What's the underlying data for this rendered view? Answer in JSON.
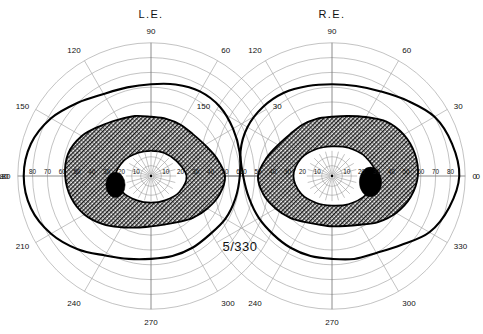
{
  "document": {
    "title": "Goldmann Kinetic Perimetry Visual Field Chart",
    "background_color": "#ffffff",
    "grid_color": "#9a9a9a",
    "isopter_color": "#000000",
    "shading_color": "#000000"
  },
  "annotation": {
    "stimulus": "5/330"
  },
  "eyes": [
    {
      "id": "left-eye",
      "title": "L.E.",
      "center_x": 151,
      "center_y": 176,
      "nasal_direction": "right",
      "temporal_direction": "left",
      "angle_labels": [
        {
          "value": "0",
          "deg": 0
        },
        {
          "value": "30",
          "deg": 30
        },
        {
          "value": "60",
          "deg": 60
        },
        {
          "value": "90",
          "deg": 90
        },
        {
          "value": "120",
          "deg": 120
        },
        {
          "value": "150",
          "deg": 150
        },
        {
          "value": "180",
          "deg": 180
        },
        {
          "value": "210",
          "deg": 210
        },
        {
          "value": "240",
          "deg": 240
        },
        {
          "value": "270",
          "deg": 270
        },
        {
          "value": "300",
          "deg": 300
        },
        {
          "value": "330",
          "deg": 330
        }
      ],
      "radial_labels_temporal": [
        "80",
        "70",
        "60",
        "50",
        "40",
        "30",
        "20",
        "10"
      ],
      "radial_labels_nasal": [
        "10",
        "20",
        "30",
        "40",
        "50",
        "60"
      ],
      "blind_spot": {
        "cx": -24,
        "cy": 6,
        "rx": 6.5,
        "ry": 8.5
      }
    },
    {
      "id": "right-eye",
      "title": "R.E.",
      "center_x": 332,
      "center_y": 176,
      "nasal_direction": "left",
      "temporal_direction": "right",
      "angle_labels": [
        {
          "value": "0",
          "deg": 0
        },
        {
          "value": "30",
          "deg": 30
        },
        {
          "value": "60",
          "deg": 60
        },
        {
          "value": "90",
          "deg": 90
        },
        {
          "value": "120",
          "deg": 120
        },
        {
          "value": "150",
          "deg": 150
        },
        {
          "value": "180",
          "deg": 180
        },
        {
          "value": "210",
          "deg": 210
        },
        {
          "value": "240",
          "deg": 240
        },
        {
          "value": "270",
          "deg": 270
        },
        {
          "value": "300",
          "deg": 300
        },
        {
          "value": "330",
          "deg": 330
        }
      ],
      "radial_labels_nasal": [
        "60",
        "50",
        "40",
        "30",
        "20",
        "10"
      ],
      "radial_labels_temporal": [
        "10",
        "20",
        "30",
        "40",
        "50",
        "60",
        "70",
        "80"
      ],
      "blind_spot": {
        "cx": 26,
        "cy": 4,
        "rx": 7.5,
        "ry": 10
      }
    }
  ],
  "chart_data": {
    "type": "line",
    "subtype": "polar-isopter-perimetry",
    "xlabel": "Meridian (degrees)",
    "ylabel": "Eccentricity (degrees)",
    "rlim": [
      0,
      90
    ],
    "r_ticks": [
      10,
      20,
      30,
      40,
      50,
      60,
      70,
      80,
      90
    ],
    "theta_ticks": [
      0,
      30,
      60,
      90,
      120,
      150,
      180,
      210,
      240,
      270,
      300,
      330
    ],
    "grid": true,
    "legend_position": "none",
    "annotations": [
      "5/330"
    ],
    "series": [
      {
        "name": "L.E. outer isopter",
        "eye": "left",
        "stimulus": "5/330",
        "theta": [
          0,
          15,
          30,
          45,
          60,
          75,
          90,
          105,
          120,
          135,
          150,
          165,
          180,
          195,
          210,
          225,
          240,
          255,
          270,
          285,
          300,
          315,
          330,
          345
        ],
        "r": [
          60,
          62,
          64,
          66,
          66,
          64,
          62,
          62,
          64,
          70,
          78,
          84,
          86,
          84,
          78,
          70,
          62,
          58,
          56,
          56,
          56,
          56,
          58,
          59
        ]
      },
      {
        "name": "L.E. inner isopter (shaded boundary)",
        "eye": "left",
        "theta": [
          0,
          15,
          30,
          45,
          60,
          75,
          90,
          105,
          120,
          135,
          150,
          165,
          180,
          195,
          210,
          225,
          240,
          255,
          270,
          285,
          300,
          315,
          330,
          345
        ],
        "r": [
          50,
          46,
          42,
          40,
          40,
          40,
          40,
          42,
          44,
          48,
          54,
          58,
          58,
          56,
          52,
          46,
          40,
          36,
          34,
          34,
          36,
          40,
          44,
          48
        ]
      },
      {
        "name": "L.E. central clear zone",
        "eye": "left",
        "theta": [
          0,
          30,
          60,
          90,
          120,
          150,
          180,
          210,
          240,
          270,
          300,
          330
        ],
        "r": [
          24,
          20,
          18,
          17,
          18,
          21,
          24,
          22,
          19,
          18,
          19,
          22
        ]
      },
      {
        "name": "R.E. outer isopter",
        "eye": "right",
        "stimulus": "5/330",
        "theta": [
          0,
          15,
          30,
          45,
          60,
          75,
          90,
          105,
          120,
          135,
          150,
          165,
          180,
          195,
          210,
          225,
          240,
          255,
          270,
          285,
          300,
          315,
          330,
          345
        ],
        "r": [
          86,
          84,
          80,
          72,
          66,
          63,
          62,
          63,
          65,
          66,
          66,
          64,
          60,
          58,
          57,
          56,
          56,
          56,
          56,
          58,
          60,
          66,
          76,
          82
        ]
      },
      {
        "name": "R.E. inner isopter (shaded boundary)",
        "eye": "right",
        "theta": [
          0,
          15,
          30,
          45,
          60,
          75,
          90,
          105,
          120,
          135,
          150,
          165,
          180,
          195,
          210,
          225,
          240,
          255,
          270,
          285,
          300,
          315,
          330,
          345
        ],
        "r": [
          58,
          58,
          56,
          52,
          46,
          42,
          40,
          40,
          40,
          40,
          42,
          46,
          50,
          48,
          44,
          40,
          36,
          34,
          34,
          35,
          38,
          44,
          50,
          55
        ]
      },
      {
        "name": "R.E. central clear zone",
        "eye": "right",
        "theta": [
          0,
          30,
          60,
          90,
          120,
          150,
          180,
          210,
          240,
          270,
          300,
          330
        ],
        "r": [
          30,
          26,
          22,
          20,
          21,
          24,
          26,
          24,
          21,
          20,
          22,
          26
        ]
      }
    ]
  }
}
